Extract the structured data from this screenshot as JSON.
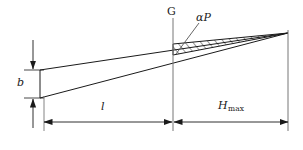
{
  "figure": {
    "type": "engineering-diagram",
    "background_color": "#ffffff",
    "line_color": "#1a1a1a",
    "hatch_color": "#1a1a1a"
  },
  "labels": {
    "vertical_axis": "G",
    "hatched_region": "αP",
    "thickness": "b",
    "length": "l",
    "max_height_base": "H",
    "max_height_sub": "max"
  },
  "geometry": {
    "left_edge_x": 40,
    "axis_x": 173,
    "right_edge_x": 288,
    "top_line_start_y": 70,
    "bottom_line_start_y": 98,
    "apex_y": 33,
    "dim_line_y": 122
  }
}
